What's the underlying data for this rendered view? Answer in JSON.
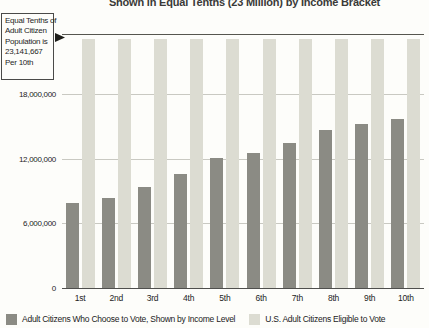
{
  "chart_data": {
    "type": "bar",
    "title": "Shown in Equal Tenths (23 Million) by Income Bracket",
    "xlabel": "",
    "ylabel": "",
    "categories": [
      "1st",
      "2nd",
      "3rd",
      "4th",
      "5th",
      "6th",
      "7th",
      "8th",
      "9th",
      "10th"
    ],
    "series": [
      {
        "name": "Adult Citizens Who Choose to Vote, Shown by Income Level",
        "color": "#8b8b84",
        "values": [
          7900000,
          8400000,
          9400000,
          10600000,
          12100000,
          12500000,
          13500000,
          14700000,
          15200000,
          15700000
        ]
      },
      {
        "name": "U.S. Adult Citizens Eligible to Vote",
        "color": "#dcdcd2",
        "values": [
          23141667,
          23141667,
          23141667,
          23141667,
          23141667,
          23141667,
          23141667,
          23141667,
          23141667,
          23141667
        ]
      }
    ],
    "ylim": [
      0,
      23600000
    ],
    "yticks": [
      0,
      6000000,
      12000000,
      18000000
    ],
    "ytick_labels": [
      "0",
      "6,000,000",
      "12,000,000",
      "18,000,000"
    ],
    "grid": true,
    "legend_position": "bottom"
  },
  "annotation": {
    "line1": "Equal Tenths of",
    "line2": "Adult Citizen",
    "line3": "Population is",
    "line4": "23,141,667",
    "line5": "Per 10th",
    "points_to_value": 23141667
  },
  "legend": {
    "items": [
      {
        "label": "Adult Citizens Who Choose to Vote, Shown by Income Level",
        "color": "#8b8b84"
      },
      {
        "label": "U.S. Adult Citizens Eligible to Vote",
        "color": "#dcdcd2"
      }
    ]
  },
  "colors": {
    "dark_bar": "#8b8b84",
    "light_bar": "#dcdcd2",
    "grid": "#c9c9c2",
    "axis": "#4f4f4d",
    "background": "#fdfdfa",
    "text": "#24241e"
  }
}
